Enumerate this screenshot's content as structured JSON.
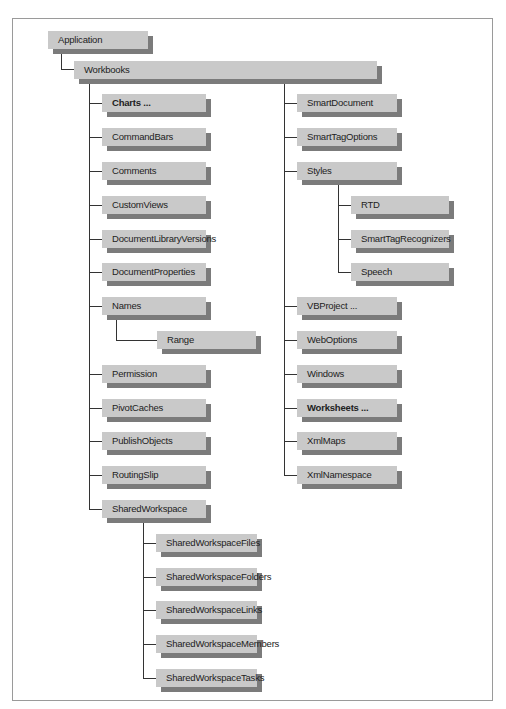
{
  "diagram": {
    "root": {
      "label": "Application",
      "children": [
        {
          "label": "Workbooks",
          "children_left": [
            {
              "label": "Charts ...",
              "bold": true
            },
            {
              "label": "CommandBars"
            },
            {
              "label": "Comments"
            },
            {
              "label": "CustomViews"
            },
            {
              "label": "DocumentLibraryVersions"
            },
            {
              "label": "DocumentProperties"
            },
            {
              "label": "Names",
              "children": [
                {
                  "label": "Range"
                }
              ]
            },
            {
              "label": "Permission"
            },
            {
              "label": "PivotCaches"
            },
            {
              "label": "PublishObjects"
            },
            {
              "label": "RoutingSlip"
            },
            {
              "label": "SharedWorkspace",
              "children": [
                {
                  "label": "SharedWorkspaceFiles"
                },
                {
                  "label": "SharedWorkspaceFolders"
                },
                {
                  "label": "SharedWorkspaceLinks"
                },
                {
                  "label": "SharedWorkspaceMembers"
                },
                {
                  "label": "SharedWorkspaceTasks"
                }
              ]
            }
          ],
          "children_right": [
            {
              "label": "SmartDocument"
            },
            {
              "label": "SmartTagOptions"
            },
            {
              "label": "Styles",
              "children": [
                {
                  "label": "RTD"
                },
                {
                  "label": "SmartTagRecognizers"
                },
                {
                  "label": "Speech"
                }
              ]
            },
            {
              "label": "VBProject ..."
            },
            {
              "label": "WebOptions"
            },
            {
              "label": "Windows"
            },
            {
              "label": "Worksheets ...",
              "bold": true
            },
            {
              "label": "XmlMaps"
            },
            {
              "label": "XmlNamespace"
            }
          ]
        }
      ]
    }
  },
  "colors": {
    "box_fill": "#c9c9c9",
    "box_shadow": "#7b7b7b",
    "connector": "#333333",
    "frame": "#9a9a9a"
  }
}
